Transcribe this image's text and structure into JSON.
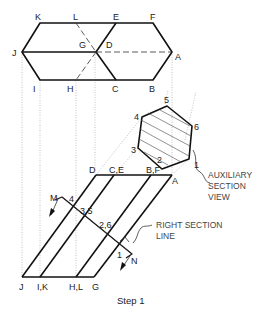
{
  "title": "Step 1",
  "top_view": {
    "labels": {
      "K": "K",
      "L": "L",
      "E": "E",
      "F": "F",
      "J": "J",
      "G": "G",
      "D": "D",
      "A": "A",
      "I": "I",
      "H": "H",
      "C": "C",
      "B": "B"
    }
  },
  "auxiliary_view": {
    "vertices": {
      "v1": "1",
      "v2": "2",
      "v3": "3",
      "v4": "4",
      "v5": "5",
      "v6": "6"
    },
    "note_line1": "AUXILIARY",
    "note_line2": "SECTION",
    "note_line3": "VIEW"
  },
  "front_view": {
    "top_labels": {
      "D": "D",
      "CE": "C,E",
      "BF": "B,F",
      "A": "A"
    },
    "bottom_labels": {
      "J": "J",
      "IK": "I,K",
      "HL": "H,L",
      "G": "G"
    },
    "section_labels": {
      "M": "M",
      "N": "N",
      "p4": "4",
      "p35": "3,5",
      "p26": "2,6",
      "p1": "1"
    },
    "note_line1": "RIGHT SECTION",
    "note_line2": "LINE"
  }
}
